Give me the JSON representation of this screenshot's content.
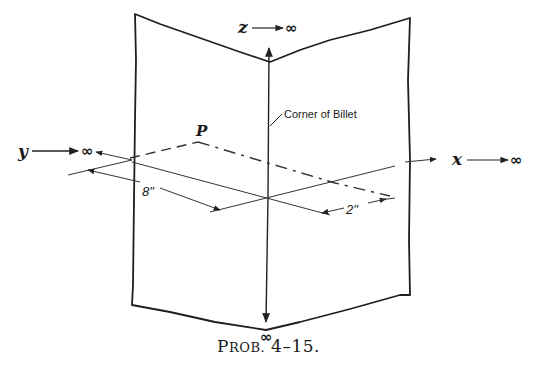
{
  "diagram": {
    "axes": {
      "z": {
        "label": "z",
        "infinity": "∞"
      },
      "y": {
        "label": "y",
        "infinity": "∞"
      },
      "x": {
        "label": "x",
        "infinity": "∞"
      },
      "down": {
        "infinity": "∞"
      }
    },
    "annotations": {
      "corner": "Corner of Billet",
      "point": "P",
      "dim_8": "8\"",
      "dim_2": "2\""
    },
    "caption": {
      "first": "P",
      "rest": "ROB.",
      "number": " 4–15."
    }
  }
}
